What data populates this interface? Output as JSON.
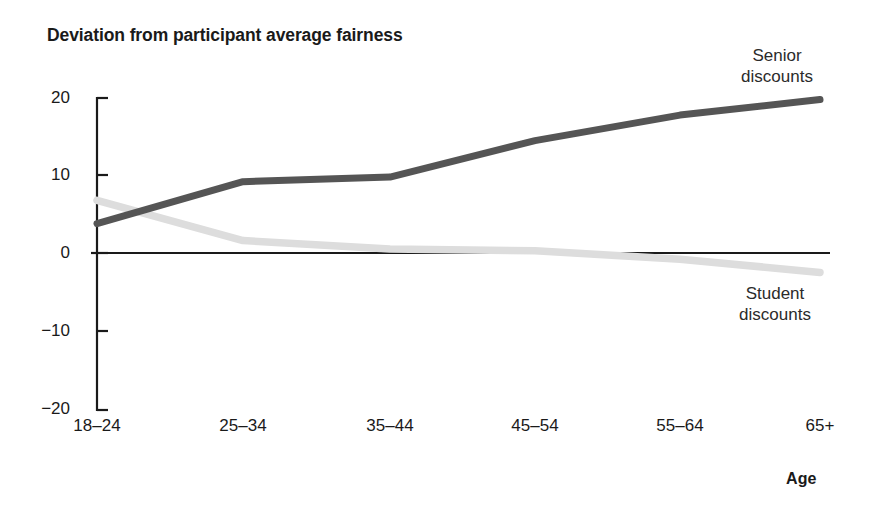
{
  "chart_data": {
    "type": "line",
    "title": "Deviation from participant average fairness",
    "xlabel": "Age",
    "ylabel": "",
    "categories": [
      "18–24",
      "25–34",
      "35–44",
      "45–54",
      "55–64",
      "65+"
    ],
    "ylim": [
      -20,
      20
    ],
    "yticks": [
      20,
      10,
      0,
      -10,
      -20
    ],
    "ytick_labels": [
      "20",
      "10",
      "0",
      "−10",
      "−20"
    ],
    "grid": false,
    "legend_position": "inline-annotation",
    "zero_line": true,
    "series": [
      {
        "name": "Senior discounts",
        "color": "#555555",
        "values": [
          3.8,
          9.2,
          9.8,
          14.5,
          17.8,
          19.8
        ]
      },
      {
        "name": "Student discounts",
        "color": "#dddddd",
        "values": [
          6.8,
          1.6,
          0.5,
          0.3,
          -0.8,
          -2.5
        ]
      }
    ],
    "annotations": [
      {
        "name": "senior-annotation",
        "text": "Senior\ndiscounts",
        "line1": "Senior",
        "line2": "discounts"
      },
      {
        "name": "student-annotation",
        "text": "Student\ndiscounts",
        "line1": "Student",
        "line2": "discounts"
      }
    ]
  },
  "labels": {
    "title": "Deviation from participant average fairness",
    "x_axis_title": "Age",
    "senior_line1": "Senior",
    "senior_line2": "discounts",
    "student_line1": "Student",
    "student_line2": "discounts"
  },
  "axis": {
    "y": {
      "t0": "20",
      "t1": "10",
      "t2": "0",
      "t3": "−10",
      "t4": "−20"
    },
    "x": {
      "t0": "18–24",
      "t1": "25–34",
      "t2": "35–44",
      "t3": "45–54",
      "t4": "55–64",
      "t5": "65+"
    }
  },
  "colors": {
    "senior": "#555555",
    "student": "#dddddd",
    "axis": "#1a1a1a",
    "background": "#ffffff"
  }
}
